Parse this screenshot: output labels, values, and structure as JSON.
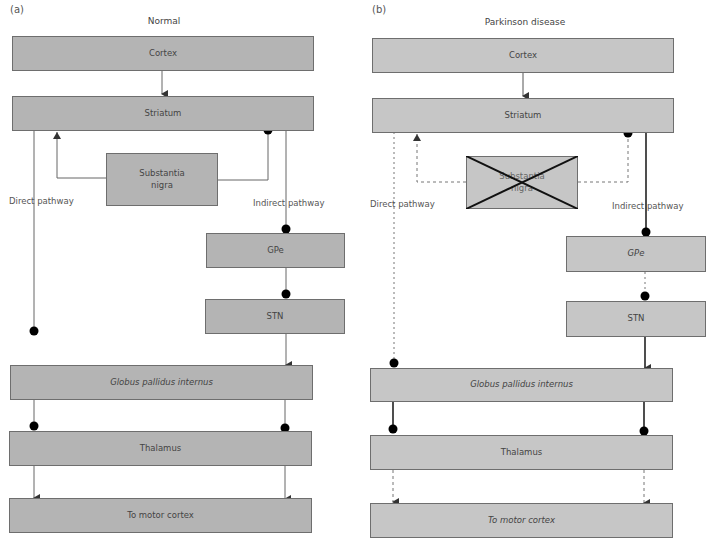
{
  "colors": {
    "box_fill_normal": "#b4b4b4",
    "box_fill_parkinson": "#c6c6c6",
    "box_border": "#6e6e6e",
    "line": "#555555",
    "line_strong": "#222222",
    "dot": "#000000",
    "cross": "#111111"
  },
  "panels": [
    {
      "id": "a",
      "label": "(a)",
      "title": "Normal",
      "direct_label": "Direct pathway",
      "indirect_label": "Indirect pathway",
      "boxes": {
        "cortex": "Cortex",
        "striatum": "Striatum",
        "substantia_nigra": "Substantia\nnigra",
        "gpe": "GPe",
        "stn": "STN",
        "gpi": "Globus pallidus internus",
        "thalamus": "Thalamus",
        "motor": "To motor cortex"
      }
    },
    {
      "id": "b",
      "label": "(b)",
      "title": "Parkinson disease",
      "direct_label": "Direct pathway",
      "indirect_label": "Indirect pathway",
      "boxes": {
        "cortex": "Cortex",
        "striatum": "Striatum",
        "substantia_nigra": "Substantia\nnigra",
        "gpe": "GPe",
        "stn": "STN",
        "gpi": "Globus pallidus internus",
        "thalamus": "Thalamus",
        "motor": "To motor cortex"
      }
    }
  ],
  "legend_semantics": {
    "arrow": "excitatory",
    "dot": "inhibitory",
    "dashed": "reduced activity",
    "bold": "increased activity",
    "cross": "degenerated"
  }
}
